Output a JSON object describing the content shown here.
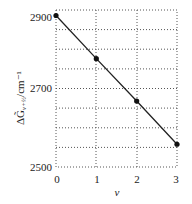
{
  "chart_data": {
    "type": "line",
    "title": "",
    "xlabel": "v",
    "ylabel": "ΔG̃v+½/cm⁻¹",
    "x": [
      0,
      1,
      2,
      3
    ],
    "series": [
      {
        "name": "ΔG v+1/2",
        "values": [
          2886,
          2776,
          2668,
          2558
        ]
      }
    ],
    "xlim": [
      0,
      3
    ],
    "ylim": [
      2500,
      2900
    ],
    "xticks": [
      "0",
      "1",
      "2",
      "3"
    ],
    "yticks": [
      "2500",
      "2700",
      "2900"
    ],
    "grid": true,
    "legend": "none"
  },
  "labels": {
    "y_top": "2900",
    "y_mid": "2700",
    "y_bot": "2500",
    "x0": "0",
    "x1": "1",
    "x2": "2",
    "x3": "3",
    "xlabel": "v",
    "ylabel_main": "ΔG̃",
    "ylabel_sub": "v+½",
    "ylabel_unit": "/cm⁻¹"
  }
}
